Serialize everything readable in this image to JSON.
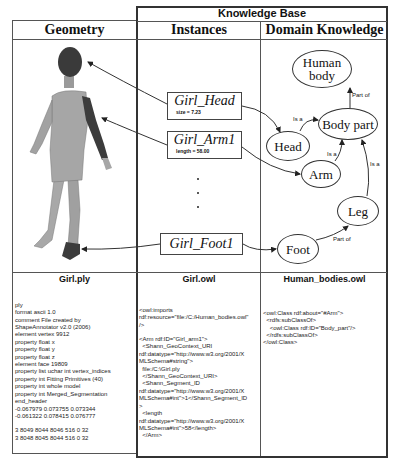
{
  "knowledge_base": {
    "title": "Knowledge Base",
    "columns": {
      "geometry": "Geometry",
      "instances": "Instances",
      "domain_knowledge": "Domain Knowledge"
    }
  },
  "instances": [
    {
      "name": "Girl_Head",
      "attribute": "size = 7.23"
    },
    {
      "name": "Girl_Arm1",
      "attribute": "length = 58.00"
    },
    {
      "name": "Girl_Foot1",
      "attribute": ""
    }
  ],
  "ellipsis_dots": [
    "•",
    "•",
    "•"
  ],
  "domain_nodes": {
    "human_body": "Human\nbody",
    "body_part": "Body part",
    "head": "Head",
    "arm": "Arm",
    "leg": "Leg",
    "foot": "Foot"
  },
  "edge_labels": {
    "body_part_human_body": "Part of",
    "head_body_part": "Is a",
    "arm_body_part": "Is a",
    "leg_body_part": "Is a",
    "foot_leg": "Part of"
  },
  "files": {
    "ply": {
      "name": "Girl.ply",
      "lines": [
        "ply",
        "format ascii 1.0",
        "comment File created by",
        "ShapeAnnotator v2.0 (2006)",
        "element vertex 9912",
        "property float x",
        "property float y",
        "property float z",
        "element face 19809",
        "property list uchar int vertex_indices",
        "property int Fitting Primitives (40)",
        "property int whole model",
        "property int Merged_Segmentation",
        "end_header",
        "-0.067979 0.073755 0.073344",
        "-0.061322 0.078415 0.076777",
        "",
        "3 8049 8044 8046 516 0 32",
        "3 8048 8045 8044 516 0 32"
      ]
    },
    "owl": {
      "name": "Girl.owl",
      "lines": [
        "<owl:imports",
        "rdf:resource=\"file:/C:/Human_bodies.owl\"",
        "/>",
        "",
        "<Arm rdf:ID=\"Girl_arm1\">",
        "  <Shann_GeoContext_URI",
        "rdf:datatype=\"http://www.w3.org/2001/X",
        "MLSchema#string\">",
        "  file:/C:\\Girl.ply",
        "  </Shann_GeoContext_URI>",
        "  <Shann_Segment_ID",
        "rdf:datatype=\"http://www.w3.org/2001/X",
        "MLSchema#int\">1</Shann_Segment_ID",
        ">",
        "  <length",
        "rdf:datatype=\"http://www.w3.org/2001/X",
        "MLSchema#int\">58</length>",
        "  </Arm>"
      ]
    },
    "human_bodies": {
      "name": "Human_bodies.owl",
      "lines": [
        "<owl:Class rdf:about=\"#Arm\">",
        "  <rdfs:subClassOf>",
        "    <owl:Class rdf:ID=\"Body_part\"/>",
        "  </rdfs:subClassOf>",
        "</owl:Class>"
      ]
    }
  },
  "colors": {
    "body": "#9a9a9a",
    "highlight_segment": "#3c3c3c",
    "lines": "#333333"
  }
}
